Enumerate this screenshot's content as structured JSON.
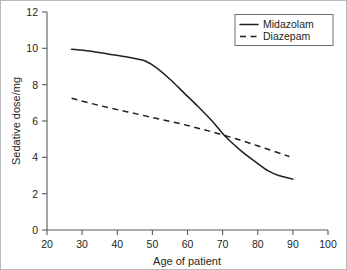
{
  "chart_data": {
    "type": "line",
    "title": "",
    "xlabel": "Age of patient",
    "ylabel": "Sedative dose/mg",
    "xlim": [
      20,
      100
    ],
    "ylim": [
      0,
      12
    ],
    "xticks": [
      20,
      30,
      40,
      50,
      60,
      70,
      80,
      90,
      100
    ],
    "xtick_labels": [
      "20",
      "30",
      "40",
      "50",
      "60",
      "70",
      "80",
      "90",
      "100"
    ],
    "yticks": [
      0,
      2,
      4,
      6,
      8,
      10,
      12
    ],
    "ytick_labels": [
      "0",
      "2",
      "4",
      "6",
      "8",
      "10",
      "12"
    ],
    "grid": false,
    "legend_position": "top-right",
    "series": [
      {
        "name": "Midazolam",
        "style": "solid",
        "color": "#231f20",
        "x": [
          27,
          32,
          37,
          42,
          46,
          48,
          51,
          55,
          59,
          63,
          67,
          71,
          75,
          79,
          83,
          86,
          90
        ],
        "values": [
          9.95,
          9.85,
          9.7,
          9.55,
          9.4,
          9.3,
          8.95,
          8.3,
          7.55,
          6.8,
          6.0,
          5.1,
          4.4,
          3.8,
          3.25,
          3.0,
          2.8
        ]
      },
      {
        "name": "Diazepam",
        "style": "dashed",
        "color": "#231f20",
        "x": [
          27,
          35,
          43,
          51,
          59,
          67,
          75,
          82,
          89
        ],
        "values": [
          7.25,
          6.85,
          6.5,
          6.15,
          5.8,
          5.4,
          4.95,
          4.5,
          4.05
        ]
      }
    ]
  },
  "legend": {
    "entries": [
      {
        "label": "Midazolam",
        "style": "solid"
      },
      {
        "label": "Diazepam",
        "style": "dashed"
      }
    ]
  },
  "axes": {
    "x_title": "Age of patient",
    "y_title": "Sedative dose/mg"
  }
}
